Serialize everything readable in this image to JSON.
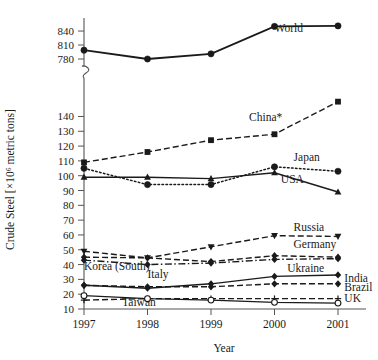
{
  "chart_data": {
    "type": "line",
    "title": "",
    "xlabel": "Year",
    "ylabel": "Crude Steel [×10⁶ metric tons]",
    "categories": [
      "1997",
      "1998",
      "1999",
      "2000",
      "2001"
    ],
    "x": [
      1997,
      1998,
      1999,
      2000,
      2001
    ],
    "grid": false,
    "legend_position": "inline-labels",
    "axis_break": true,
    "y_axis": {
      "lower_segment": {
        "min": 10,
        "max": 140,
        "ticks": [
          10,
          20,
          30,
          40,
          50,
          60,
          70,
          80,
          90,
          100,
          110,
          120,
          130,
          140
        ]
      },
      "upper_segment": {
        "min": 780,
        "max": 850,
        "ticks": [
          780,
          810,
          840
        ]
      },
      "break_note": "axis break between 140 and 780"
    },
    "series": [
      {
        "name": "World",
        "values": [
          799,
          780,
          791,
          850,
          851
        ],
        "marker": "circle",
        "line": "solid",
        "label_x": 2000.0,
        "label_y": 838
      },
      {
        "name": "China*",
        "values": [
          109,
          116,
          124,
          128,
          150
        ],
        "marker": "square",
        "line": "dashed",
        "label_x": 1999.6,
        "label_y": 137
      },
      {
        "name": "Japan",
        "values": [
          105,
          94,
          94,
          106,
          103
        ],
        "marker": "circle",
        "line": "dotted",
        "label_x": 2000.3,
        "label_y": 110
      },
      {
        "name": "USA",
        "values": [
          99,
          99,
          98,
          102,
          89
        ],
        "marker": "triangle-up",
        "line": "solid",
        "label_x": 2000.1,
        "label_y": 95
      },
      {
        "name": "Russia",
        "values": [
          49,
          44.5,
          52,
          59.5,
          59
        ],
        "marker": "triangle-down",
        "line": "dashed",
        "label_x": 2000.3,
        "label_y": 63
      },
      {
        "name": "Germany",
        "values": [
          45,
          44.5,
          42,
          46,
          45
        ],
        "marker": "diamond",
        "line": "dashed",
        "label_x": 2000.3,
        "label_y": 51
      },
      {
        "name": "Ukraine",
        "values": [
          26,
          24,
          27,
          32,
          33
        ],
        "marker": "diamond",
        "line": "solid",
        "label_x": 2000.2,
        "label_y": 35
      },
      {
        "name": "Korea (South)",
        "values": [
          43,
          40,
          41,
          43.5,
          44
        ],
        "marker": "diamond",
        "line": "dash-dot",
        "label_x": 1997.0,
        "label_y": 36
      },
      {
        "name": "Italy",
        "values": [
          26,
          25,
          25,
          27,
          27
        ],
        "marker": "diamond",
        "line": "dashed",
        "label_x": 1998.0,
        "label_y": 31
      },
      {
        "name": "India",
        "values": [
          26,
          25,
          25,
          27,
          27
        ],
        "marker": "none",
        "line": "none",
        "label_x": 2001.1,
        "label_y": 28
      },
      {
        "name": "Brazil",
        "values": [
          26,
          25,
          25,
          27,
          27
        ],
        "marker": "none",
        "line": "none",
        "label_x": 2001.1,
        "label_y": 22
      },
      {
        "name": "Taiwan",
        "values": [
          16,
          17,
          17,
          17,
          17
        ],
        "marker": "plus",
        "line": "dashed",
        "label_x": 1997.6,
        "label_y": 12
      },
      {
        "name": "UK",
        "values": [
          19,
          17,
          16,
          14.5,
          14
        ],
        "marker": "open-circle",
        "line": "solid",
        "label_x": 2001.1,
        "label_y": 15
      }
    ]
  },
  "colors": {
    "ink": "#1a1a1a",
    "axis": "#555555",
    "background": "#ffffff"
  }
}
